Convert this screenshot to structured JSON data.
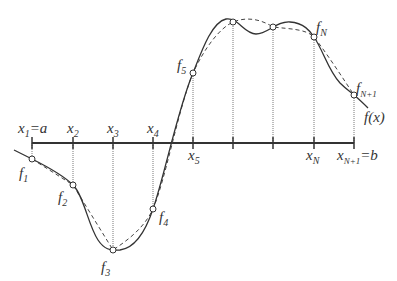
{
  "diagram": {
    "colors": {
      "stroke": "#333333",
      "background": "#ffffff",
      "guide": "#555555"
    },
    "axis": {
      "y": 143,
      "x_start": 32,
      "x_end": 354,
      "ticks": [
        32,
        73,
        113,
        153,
        193,
        233,
        273,
        314,
        354
      ]
    },
    "x_labels": [
      {
        "base": "x",
        "sub": "1",
        "tail": "=a",
        "x": 18,
        "y": 133
      },
      {
        "base": "x",
        "sub": "2",
        "tail": "",
        "x": 67,
        "y": 133
      },
      {
        "base": "x",
        "sub": "3",
        "tail": "",
        "x": 107,
        "y": 133
      },
      {
        "base": "x",
        "sub": "4",
        "tail": "",
        "x": 147,
        "y": 133
      },
      {
        "base": "x",
        "sub": "5",
        "tail": "",
        "x": 188,
        "y": 160
      },
      {
        "base": "x",
        "sub": "N",
        "tail": "",
        "x": 306,
        "y": 160
      },
      {
        "base": "x",
        "sub": "N+1",
        "tail": "=b",
        "x": 337,
        "y": 160
      }
    ],
    "nodes": [
      {
        "name": "f1",
        "x": 32,
        "y": 159
      },
      {
        "name": "f2",
        "x": 73,
        "y": 185
      },
      {
        "name": "f3",
        "x": 113,
        "y": 250
      },
      {
        "name": "f4",
        "x": 153,
        "y": 209
      },
      {
        "name": "f5",
        "x": 193,
        "y": 73
      },
      {
        "name": "f6",
        "x": 233,
        "y": 22
      },
      {
        "name": "f7",
        "x": 273,
        "y": 27
      },
      {
        "name": "fN",
        "x": 314,
        "y": 37
      },
      {
        "name": "fN+1",
        "x": 354,
        "y": 95
      }
    ],
    "f_labels": [
      {
        "base": "f",
        "sub": "1",
        "x": 19,
        "y": 178
      },
      {
        "base": "f",
        "sub": "2",
        "x": 58,
        "y": 202
      },
      {
        "base": "f",
        "sub": "3",
        "x": 101,
        "y": 272
      },
      {
        "base": "f",
        "sub": "4",
        "x": 159,
        "y": 222
      },
      {
        "base": "f",
        "sub": "5",
        "x": 177,
        "y": 70
      },
      {
        "base": "f",
        "sub": "N",
        "x": 316,
        "y": 32
      },
      {
        "base": "f",
        "sub": "N+1",
        "x": 356,
        "y": 93
      }
    ],
    "function_label": "f(x)",
    "function_label_pos": {
      "x": 364,
      "y": 122
    },
    "curve_path": "M 14 150 C 22 154, 28 157, 32 159 C 48 167, 64 176, 73 185 C 84 196, 88 225, 98 240 C 104 249, 110 251, 120 250 C 135 248, 146 230, 153 209 C 164 178, 178 108, 193 73 C 202 50, 212 22, 226 19 C 238 17, 244 34, 256 34 C 268 34, 276 21, 290 22 C 304 23, 310 31, 314 37 C 324 52, 328 70, 340 83 C 346 89, 352 93, 354 95 C 360 100, 364 104, 368 108",
    "dashed_path": "M 32 159 L 73 185 L 113 250 C 128 240, 144 228, 153 209 C 166 178, 178 110, 193 73 C 205 47, 220 28, 233 22 C 248 16, 262 20, 273 27 C 290 29, 306 29, 314 37 C 328 55, 344 80, 354 95"
  }
}
